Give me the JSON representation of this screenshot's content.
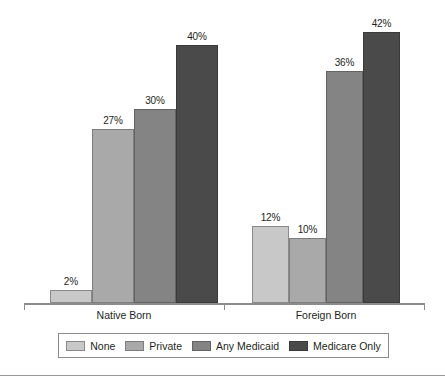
{
  "chart_data": {
    "type": "bar",
    "title": "",
    "subtitle": "",
    "xlabel": "",
    "ylabel": "",
    "ylim": [
      0,
      42
    ],
    "grid": false,
    "legend_position": "bottom",
    "value_suffix": "%",
    "categories": [
      "Native Born",
      "Foreign Born"
    ],
    "series": [
      {
        "name": "None",
        "color": "#c8c8c8",
        "edge": "#8a8a8a",
        "values": [
          2,
          12
        ],
        "labels": [
          "2%",
          "12%"
        ]
      },
      {
        "name": "Private",
        "color": "#a9a9a9",
        "edge": "#7d7d7d",
        "values": [
          27,
          10
        ],
        "labels": [
          "27%",
          "10%"
        ]
      },
      {
        "name": "Any Medicaid",
        "color": "#848484",
        "edge": "#636363",
        "values": [
          30,
          36
        ],
        "labels": [
          "30%",
          "36%"
        ]
      },
      {
        "name": "Medicare Only",
        "color": "#4a4a4a",
        "edge": "#3a3a3a",
        "values": [
          40,
          42
        ],
        "labels": [
          "40%",
          "42%"
        ]
      }
    ],
    "annotations": []
  },
  "legend": {
    "items": [
      {
        "label": "None"
      },
      {
        "label": "Private"
      },
      {
        "label": "Any Medicaid"
      },
      {
        "label": "Medicare Only"
      }
    ]
  },
  "axis": {
    "ticks": [
      "",
      "",
      ""
    ]
  }
}
